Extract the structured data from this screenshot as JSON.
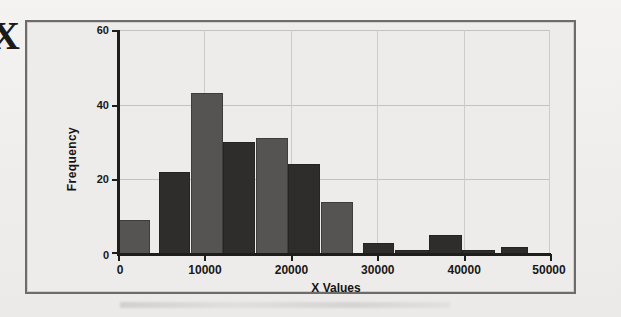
{
  "margin_glyph": "X",
  "chart_data": {
    "type": "bar",
    "title": "",
    "subtitle": "",
    "xlabel": "X Values",
    "ylabel": "Frequency",
    "xlim": [
      0,
      50000
    ],
    "ylim": [
      0,
      60
    ],
    "grid": true,
    "legend": false,
    "bin_width": 2500,
    "x_ticks": [
      0,
      10000,
      20000,
      30000,
      40000,
      50000
    ],
    "x_tick_labels": [
      "0",
      "10000",
      "20000",
      "30000",
      "40000",
      "50000"
    ],
    "y_ticks": [
      0,
      20,
      40,
      60
    ],
    "y_tick_labels": [
      "0",
      "20",
      "40",
      "60"
    ],
    "bin_edges": [
      0,
      2500,
      5000,
      7500,
      10000,
      12500,
      15000,
      17500,
      20000,
      22500,
      25000,
      27500,
      30000,
      32500,
      35000,
      37500,
      40000,
      42500,
      45000,
      47500
    ],
    "bars": [
      {
        "x0": 0,
        "x1": 3750,
        "value": 9,
        "shade": "light"
      },
      {
        "x0": 4700,
        "x1": 8350,
        "value": 22,
        "shade": "dark"
      },
      {
        "x0": 8400,
        "x1": 12100,
        "value": 43,
        "shade": "light"
      },
      {
        "x0": 12150,
        "x1": 15900,
        "value": 30,
        "shade": "dark"
      },
      {
        "x0": 15950,
        "x1": 19650,
        "value": 31,
        "shade": "light"
      },
      {
        "x0": 19700,
        "x1": 23400,
        "value": 24,
        "shade": "dark"
      },
      {
        "x0": 23450,
        "x1": 27200,
        "value": 14,
        "shade": "light"
      },
      {
        "x0": 28300,
        "x1": 32000,
        "value": 3,
        "shade": "dark"
      },
      {
        "x0": 32050,
        "x1": 36000,
        "value": 1,
        "shade": "dark"
      },
      {
        "x0": 36050,
        "x1": 39800,
        "value": 5,
        "shade": "dark"
      },
      {
        "x0": 39850,
        "x1": 43600,
        "value": 1,
        "shade": "dark"
      },
      {
        "x0": 44300,
        "x1": 47500,
        "value": 2,
        "shade": "dark"
      }
    ],
    "categories": [
      "0-3750",
      "4700-8350",
      "8400-12100",
      "12150-15900",
      "15950-19650",
      "19700-23400",
      "23450-27200",
      "28300-32000",
      "32050-36000",
      "36050-39800",
      "39850-43600",
      "44300-47500"
    ],
    "values": [
      9,
      22,
      43,
      30,
      31,
      24,
      14,
      3,
      1,
      5,
      1,
      2
    ],
    "colors": {
      "bar_light": "#555452",
      "bar_dark": "#2e2d2b",
      "axis": "#1d1d1b",
      "grid": "#c3c2c0",
      "plot_bg": "#edecea",
      "frame": "#6d6c6a"
    }
  }
}
